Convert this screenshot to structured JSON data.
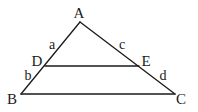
{
  "diagram": {
    "type": "triangle-with-parallel-segment",
    "stroke_color": "#1a1a1a",
    "background": "#ffffff",
    "vertices": {
      "A": {
        "label": "A",
        "x": 80,
        "y": 22,
        "lx": 79,
        "ly": 18
      },
      "B": {
        "label": "B",
        "x": 21,
        "y": 94,
        "lx": 12,
        "ly": 104
      },
      "C": {
        "label": "C",
        "x": 175,
        "y": 94,
        "lx": 181,
        "ly": 104
      },
      "D": {
        "label": "D",
        "x": 45,
        "y": 66,
        "lx": 37,
        "ly": 66
      },
      "E": {
        "label": "E",
        "x": 139,
        "y": 66,
        "lx": 146,
        "ly": 66
      }
    },
    "segments": [
      {
        "name": "AB",
        "from": "A",
        "to": "B"
      },
      {
        "name": "AC",
        "from": "A",
        "to": "C"
      },
      {
        "name": "BC",
        "from": "B",
        "to": "C"
      },
      {
        "name": "DE",
        "from": "D",
        "to": "E"
      }
    ],
    "side_labels": {
      "a": {
        "label": "a",
        "segment": "AD",
        "x": 52,
        "y": 49
      },
      "b": {
        "label": "b",
        "segment": "DB",
        "x": 28,
        "y": 80
      },
      "c": {
        "label": "c",
        "segment": "AE",
        "x": 122,
        "y": 49
      },
      "d": {
        "label": "d",
        "segment": "EC",
        "x": 163,
        "y": 80
      }
    }
  }
}
